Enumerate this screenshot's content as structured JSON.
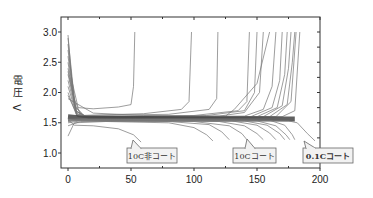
{
  "chart_data": {
    "type": "line",
    "title": "",
    "xlabel": "",
    "ylabel": "電圧 V",
    "xlim": [
      0,
      200
    ],
    "ylim": [
      0.75,
      3.25
    ],
    "x_ticks": [
      0,
      50,
      100,
      150,
      200
    ],
    "x_tick_labels": [
      "0",
      "50",
      "100",
      "150",
      "200"
    ],
    "y_ticks": [
      1.0,
      1.5,
      2.0,
      2.5,
      3.0
    ],
    "y_tick_labels": [
      "1.0",
      "1.5",
      "2.0",
      "2.5",
      "3.0"
    ],
    "grid": false,
    "legend": "none",
    "annotations": [
      {
        "text": "10C非コート",
        "box": [
          127,
          148,
          50,
          15
        ],
        "tip": [
          133,
          140
        ],
        "bold": false
      },
      {
        "text": "10Cコート",
        "box": [
          233,
          148,
          43,
          15
        ],
        "tip": [
          247,
          139
        ],
        "bold": false
      },
      {
        "text": "0.1Cコート",
        "box": [
          303,
          148,
          50,
          15
        ],
        "tip": [
          304,
          141
        ],
        "bold": true
      }
    ],
    "series": [
      {
        "name": "charge-1",
        "points": [
          [
            0,
            2.95
          ],
          [
            3,
            2.2
          ],
          [
            8,
            1.75
          ],
          [
            20,
            1.73
          ],
          [
            40,
            1.76
          ],
          [
            50,
            1.8
          ],
          [
            52,
            2.1
          ],
          [
            53,
            3.0
          ]
        ]
      },
      {
        "name": "charge-2",
        "points": [
          [
            0,
            2.9
          ],
          [
            5,
            1.9
          ],
          [
            10,
            1.62
          ],
          [
            60,
            1.65
          ],
          [
            90,
            1.72
          ],
          [
            96,
            1.85
          ],
          [
            98,
            3.0
          ]
        ]
      },
      {
        "name": "charge-3",
        "points": [
          [
            0,
            2.8
          ],
          [
            5,
            1.8
          ],
          [
            12,
            1.62
          ],
          [
            80,
            1.64
          ],
          [
            112,
            1.72
          ],
          [
            118,
            1.9
          ],
          [
            119,
            3.0
          ]
        ]
      },
      {
        "name": "charge-4",
        "points": [
          [
            0,
            2.7
          ],
          [
            6,
            1.75
          ],
          [
            14,
            1.6
          ],
          [
            100,
            1.62
          ],
          [
            135,
            1.7
          ],
          [
            142,
            1.85
          ],
          [
            144,
            3.0
          ]
        ]
      },
      {
        "name": "charge-5",
        "points": [
          [
            0,
            2.6
          ],
          [
            6,
            1.7
          ],
          [
            14,
            1.6
          ],
          [
            110,
            1.62
          ],
          [
            140,
            1.7
          ],
          [
            148,
            2.0
          ],
          [
            150,
            3.0
          ]
        ]
      },
      {
        "name": "charge-6",
        "points": [
          [
            0,
            2.5
          ],
          [
            6,
            1.7
          ],
          [
            15,
            1.59
          ],
          [
            120,
            1.61
          ],
          [
            140,
            1.67
          ],
          [
            152,
            2.0
          ],
          [
            155,
            3.0
          ]
        ]
      },
      {
        "name": "charge-7",
        "points": [
          [
            0,
            2.4
          ],
          [
            7,
            1.68
          ],
          [
            16,
            1.59
          ],
          [
            125,
            1.61
          ],
          [
            132,
            1.72
          ],
          [
            150,
            2.15
          ],
          [
            160,
            3.0
          ]
        ]
      },
      {
        "name": "charge-8",
        "points": [
          [
            0,
            2.35
          ],
          [
            7,
            1.65
          ],
          [
            16,
            1.59
          ],
          [
            140,
            1.61
          ],
          [
            155,
            1.72
          ],
          [
            162,
            2.1
          ],
          [
            165,
            3.0
          ]
        ]
      },
      {
        "name": "charge-9",
        "points": [
          [
            0,
            2.3
          ],
          [
            7,
            1.65
          ],
          [
            16,
            1.58
          ],
          [
            145,
            1.6
          ],
          [
            162,
            1.75
          ],
          [
            168,
            2.2
          ],
          [
            170,
            3.0
          ]
        ]
      },
      {
        "name": "charge-10",
        "points": [
          [
            0,
            2.2
          ],
          [
            7,
            1.63
          ],
          [
            16,
            1.58
          ],
          [
            150,
            1.6
          ],
          [
            166,
            1.75
          ],
          [
            172,
            2.3
          ],
          [
            174,
            3.0
          ]
        ]
      },
      {
        "name": "charge-11",
        "points": [
          [
            0,
            2.1
          ],
          [
            7,
            1.62
          ],
          [
            16,
            1.58
          ],
          [
            155,
            1.6
          ],
          [
            170,
            1.78
          ],
          [
            175,
            2.4
          ],
          [
            177,
            3.0
          ]
        ]
      },
      {
        "name": "charge-12",
        "points": [
          [
            0,
            2.0
          ],
          [
            7,
            1.61
          ],
          [
            16,
            1.58
          ],
          [
            160,
            1.6
          ],
          [
            174,
            1.8
          ],
          [
            178,
            2.5
          ],
          [
            180,
            3.0
          ]
        ]
      },
      {
        "name": "charge-13",
        "points": [
          [
            0,
            1.95
          ],
          [
            8,
            1.6
          ],
          [
            16,
            1.58
          ],
          [
            165,
            1.6
          ],
          [
            177,
            1.85
          ],
          [
            181,
            3.0
          ]
        ]
      },
      {
        "name": "charge-14",
        "points": [
          [
            0,
            1.9
          ],
          [
            20,
            1.66
          ],
          [
            60,
            1.62
          ],
          [
            120,
            1.6
          ],
          [
            170,
            1.6
          ],
          [
            180,
            1.7
          ],
          [
            184,
            3.0
          ]
        ]
      },
      {
        "name": "plateau-band",
        "points": [
          [
            0,
            1.6
          ],
          [
            10,
            1.58
          ],
          [
            60,
            1.57
          ],
          [
            120,
            1.56
          ],
          [
            160,
            1.56
          ],
          [
            180,
            1.56
          ]
        ]
      },
      {
        "name": "discharge-1",
        "points": [
          [
            0,
            1.55
          ],
          [
            5,
            1.46
          ],
          [
            20,
            1.45
          ],
          [
            40,
            1.4
          ],
          [
            52,
            1.3
          ],
          [
            58,
            1.18
          ]
        ]
      },
      {
        "name": "discharge-2",
        "points": [
          [
            0,
            1.28
          ],
          [
            5,
            1.5
          ],
          [
            30,
            1.52
          ],
          [
            80,
            1.5
          ],
          [
            100,
            1.42
          ],
          [
            110,
            1.3
          ],
          [
            115,
            1.2
          ]
        ]
      },
      {
        "name": "discharge-3",
        "points": [
          [
            0,
            1.45
          ],
          [
            10,
            1.52
          ],
          [
            80,
            1.52
          ],
          [
            112,
            1.47
          ],
          [
            122,
            1.35
          ],
          [
            128,
            1.22
          ]
        ]
      },
      {
        "name": "discharge-4",
        "points": [
          [
            0,
            1.5
          ],
          [
            10,
            1.53
          ],
          [
            100,
            1.52
          ],
          [
            128,
            1.45
          ],
          [
            138,
            1.32
          ],
          [
            142,
            1.22
          ]
        ]
      },
      {
        "name": "discharge-5",
        "points": [
          [
            0,
            1.52
          ],
          [
            10,
            1.54
          ],
          [
            120,
            1.52
          ],
          [
            140,
            1.45
          ],
          [
            150,
            1.32
          ],
          [
            155,
            1.22
          ]
        ]
      },
      {
        "name": "discharge-6",
        "points": [
          [
            0,
            1.53
          ],
          [
            10,
            1.54
          ],
          [
            130,
            1.53
          ],
          [
            150,
            1.46
          ],
          [
            160,
            1.33
          ],
          [
            165,
            1.22
          ]
        ]
      },
      {
        "name": "discharge-7",
        "points": [
          [
            0,
            1.54
          ],
          [
            10,
            1.55
          ],
          [
            140,
            1.53
          ],
          [
            158,
            1.46
          ],
          [
            168,
            1.32
          ],
          [
            172,
            1.22
          ]
        ]
      },
      {
        "name": "discharge-8",
        "points": [
          [
            0,
            1.54
          ],
          [
            10,
            1.55
          ],
          [
            150,
            1.53
          ],
          [
            165,
            1.45
          ],
          [
            173,
            1.3
          ],
          [
            176,
            1.22
          ]
        ]
      },
      {
        "name": "discharge-9",
        "points": [
          [
            0,
            1.55
          ],
          [
            10,
            1.56
          ],
          [
            160,
            1.54
          ],
          [
            172,
            1.46
          ],
          [
            178,
            1.3
          ],
          [
            180,
            1.22
          ]
        ]
      },
      {
        "name": "discharge-0.1C",
        "points": [
          [
            0,
            1.56
          ],
          [
            20,
            1.56
          ],
          [
            150,
            1.54
          ],
          [
            175,
            1.53
          ],
          [
            182,
            1.5
          ],
          [
            190,
            1.32
          ],
          [
            196,
            1.2
          ]
        ]
      }
    ]
  }
}
